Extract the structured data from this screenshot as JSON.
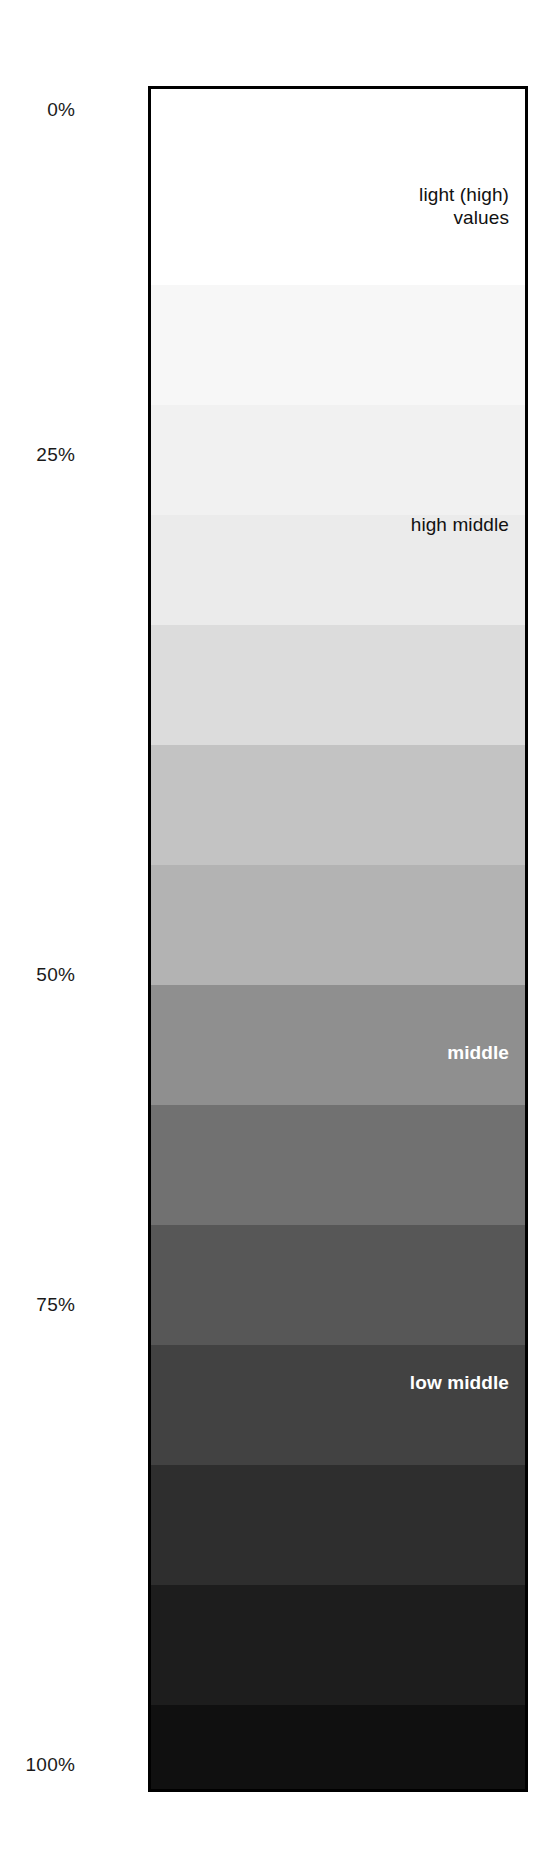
{
  "chart_data": {
    "type": "heatmap",
    "title": "",
    "subtitle": "",
    "xlabel": "",
    "ylabel": "",
    "orientation": "vertical",
    "grid": false,
    "legend_position": "none",
    "axis": {
      "label_side": "left",
      "unit": "%",
      "range": [
        0,
        100
      ],
      "ticks": [
        {
          "label": "0%",
          "value": 0,
          "y": 100
        },
        {
          "label": "25%",
          "value": 25,
          "y": 445
        },
        {
          "label": "50%",
          "value": 50,
          "y": 965
        },
        {
          "label": "75%",
          "value": 75,
          "y": 1295
        },
        {
          "label": "100%",
          "value": 100,
          "y": 1755
        }
      ]
    },
    "bands": [
      {
        "index": 0,
        "ink_percent": 0,
        "color": "#ffffff",
        "top": 0,
        "height": 196
      },
      {
        "index": 1,
        "ink_percent": 5,
        "color": "#f7f7f7",
        "top": 196,
        "height": 120
      },
      {
        "index": 2,
        "ink_percent": 9,
        "color": "#f1f1f1",
        "top": 316,
        "height": 110
      },
      {
        "index": 3,
        "ink_percent": 13,
        "color": "#ebebeb",
        "top": 426,
        "height": 110
      },
      {
        "index": 4,
        "ink_percent": 19,
        "color": "#dcdcdc",
        "top": 536,
        "height": 120
      },
      {
        "index": 5,
        "ink_percent": 28,
        "color": "#c3c3c3",
        "top": 656,
        "height": 120
      },
      {
        "index": 6,
        "ink_percent": 34,
        "color": "#b3b3b3",
        "top": 776,
        "height": 120
      },
      {
        "index": 7,
        "ink_percent": 46,
        "color": "#8f8f8f",
        "top": 896,
        "height": 120
      },
      {
        "index": 8,
        "ink_percent": 56,
        "color": "#717171",
        "top": 1016,
        "height": 120
      },
      {
        "index": 9,
        "ink_percent": 66,
        "color": "#575757",
        "top": 1136,
        "height": 120
      },
      {
        "index": 10,
        "ink_percent": 74,
        "color": "#424242",
        "top": 1256,
        "height": 120
      },
      {
        "index": 11,
        "ink_percent": 82,
        "color": "#2e2e2e",
        "top": 1376,
        "height": 120
      },
      {
        "index": 12,
        "ink_percent": 89,
        "color": "#1d1d1d",
        "top": 1496,
        "height": 120
      },
      {
        "index": 13,
        "ink_percent": 95,
        "color": "#101010",
        "top": 1616,
        "height": 84
      },
      {
        "index": 14,
        "ink_percent": 100,
        "color": "#000000",
        "top": 1700,
        "height": 106
      }
    ],
    "annotations": [
      {
        "id": "light-high-values",
        "text": "light (high)\nvalues",
        "y": 94,
        "tone": "dark",
        "bold": false
      },
      {
        "id": "high-middle",
        "text": "high middle",
        "y": 424,
        "tone": "dark",
        "bold": false
      },
      {
        "id": "middle",
        "text": "middle",
        "y": 952,
        "tone": "light",
        "bold": true
      },
      {
        "id": "low-middle",
        "text": "low middle",
        "y": 1282,
        "tone": "light",
        "bold": true
      },
      {
        "id": "dark-low-values",
        "text": "dark (low)\nvalues",
        "y": 1716,
        "tone": "light",
        "bold": true
      }
    ]
  }
}
